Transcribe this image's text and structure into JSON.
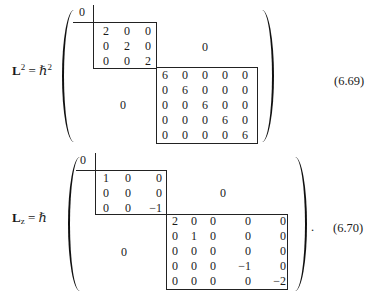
{
  "equations": [
    {
      "id": "eq-6-69",
      "lhs_symbol": "L",
      "lhs_sup": "2",
      "lhs_sub": "",
      "equals": "=",
      "prefactor": "ℏ",
      "prefactor_sup": "2",
      "number": "(6.69)",
      "trailing_punct": "",
      "top_left_cell": "0",
      "upper_right_zero": "0",
      "lower_left_zero": "0",
      "block_3x3": [
        [
          "2",
          "0",
          "0"
        ],
        [
          "0",
          "2",
          "0"
        ],
        [
          "0",
          "0",
          "2"
        ]
      ],
      "block_5x5": [
        [
          "6",
          "0",
          "0",
          "0",
          "0"
        ],
        [
          "0",
          "6",
          "0",
          "0",
          "0"
        ],
        [
          "0",
          "0",
          "6",
          "0",
          "0"
        ],
        [
          "0",
          "0",
          "0",
          "6",
          "0"
        ],
        [
          "0",
          "0",
          "0",
          "0",
          "6"
        ]
      ]
    },
    {
      "id": "eq-6-70",
      "lhs_symbol": "L",
      "lhs_sup": "",
      "lhs_sub": "z",
      "equals": "=",
      "prefactor": "ℏ",
      "prefactor_sup": "",
      "number": "(6.70)",
      "trailing_punct": ".",
      "top_left_cell": "0",
      "upper_right_zero": "0",
      "lower_left_zero": "0",
      "block_3x3": [
        [
          "1",
          "0",
          "0"
        ],
        [
          "0",
          "0",
          "0"
        ],
        [
          "0",
          "0",
          "−1"
        ]
      ],
      "block_5x5": [
        [
          "2",
          "0",
          "0",
          "0",
          "0"
        ],
        [
          "0",
          "1",
          "0",
          "0",
          "0"
        ],
        [
          "0",
          "0",
          "0",
          "0",
          "0"
        ],
        [
          "0",
          "0",
          "0",
          "−1",
          "0"
        ],
        [
          "0",
          "0",
          "0",
          "0",
          "−2"
        ]
      ]
    }
  ]
}
